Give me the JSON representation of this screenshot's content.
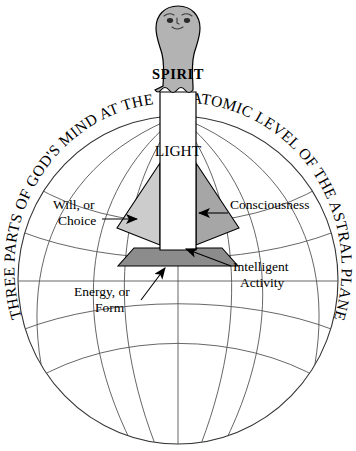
{
  "diagram": {
    "title_left_arc": "THREE PARTS OF GOD'S MIND AT THE",
    "title_right_arc": "ATOMIC LEVEL OF THE ASTRAL PLANE",
    "spirit_label": "SPIRIT",
    "light_label": "LIGHT",
    "callouts": [
      {
        "id": "will",
        "line1": "Will, or",
        "line2": "Choice"
      },
      {
        "id": "consciousness",
        "line1": "Consciousness",
        "line2": ""
      },
      {
        "id": "intelligent-activity",
        "line1": "Intelligent",
        "line2": "Activity"
      },
      {
        "id": "energy",
        "line1": "Energy, or",
        "line2": "Form"
      }
    ],
    "colors": {
      "stroke": "#000000",
      "grid_line": "#555555",
      "head_fill": "#b3b3b3",
      "shaft_fill": "#ffffff",
      "left_fin_fill": "#cccccc",
      "right_fin_fill": "#a6a6a6",
      "base_fill": "#8c8c8c",
      "background": "#ffffff"
    }
  }
}
